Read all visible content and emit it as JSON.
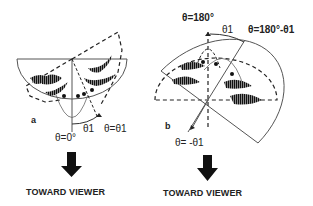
{
  "panels": [
    {
      "id": "a",
      "label": "a",
      "angle_labels": {
        "bottom": "θ=0°",
        "arc": "θ1",
        "rotated": "θ=θ1"
      },
      "arrow_caption": "TOWARD VIEWER"
    },
    {
      "id": "b",
      "label": "b",
      "angle_labels": {
        "top": "θ=180°",
        "arc": "θ1",
        "rotated": "θ=180°-θ1",
        "bottom": "θ= -θ1"
      },
      "arrow_caption": "TOWARD VIEWER"
    }
  ],
  "colors": {
    "line": "#555555",
    "fill_dark": "#1a1a1a",
    "background": "#ffffff"
  }
}
